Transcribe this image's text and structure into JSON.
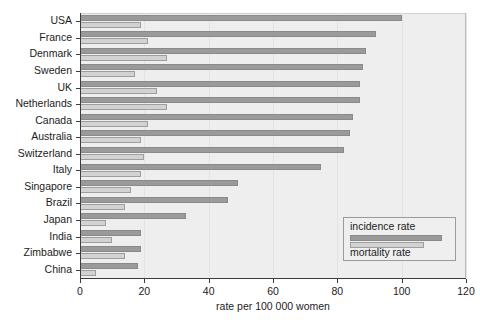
{
  "chart_data": {
    "type": "bar",
    "orientation": "horizontal",
    "title": "",
    "xlabel": "rate per 100 000 women",
    "ylabel": "",
    "xlim": [
      0,
      120
    ],
    "xticks": [
      0,
      20,
      40,
      60,
      80,
      100,
      120
    ],
    "xtick_labels": [
      "0",
      "20",
      "40",
      "60",
      "80",
      "100",
      "120"
    ],
    "grid": true,
    "legend_position": "bottom-right",
    "categories": [
      "USA",
      "France",
      "Denmark",
      "Sweden",
      "UK",
      "Netherlands",
      "Canada",
      "Australia",
      "Switzerland",
      "Italy",
      "Singapore",
      "Brazil",
      "Japan",
      "India",
      "Zimbabwe",
      "China"
    ],
    "series": [
      {
        "name": "incidence rate",
        "color": "#9a9a9a",
        "values": [
          100,
          92,
          89,
          88,
          87,
          87,
          85,
          84,
          82,
          75,
          49,
          46,
          33,
          19,
          19,
          18
        ]
      },
      {
        "name": "mortality rate",
        "color": "#d2d2d2",
        "values": [
          19,
          21,
          27,
          17,
          24,
          27,
          21,
          19,
          20,
          19,
          16,
          14,
          8,
          10,
          14,
          5
        ]
      }
    ],
    "legend_entries": [
      "incidence rate",
      "mortality rate"
    ]
  }
}
